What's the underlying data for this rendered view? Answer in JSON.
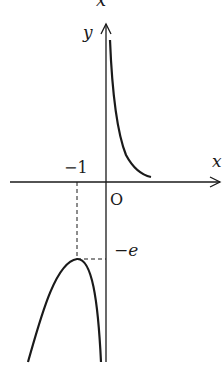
{
  "figure": {
    "type": "function-graph",
    "axes": {
      "x_label": "x",
      "y_label": "y",
      "origin_label": "O",
      "top_partial_label": "x"
    },
    "annotations": {
      "x_tick_label": "−1",
      "y_tick_label": "−e"
    },
    "features": {
      "vertical_asymptote": "x = 0",
      "local_maximum": {
        "x": -1,
        "y": "-e"
      },
      "branches": [
        {
          "domain": "x > 0",
          "shape": "decreasing from +∞ toward x-axis, above x-axis"
        },
        {
          "domain": "x < 0",
          "shape": "concave-down arch with maximum at (-1, -e), going to -∞ on both ends"
        }
      ]
    },
    "colors": {
      "ink": "#1a1a1a",
      "background": "#ffffff"
    }
  }
}
